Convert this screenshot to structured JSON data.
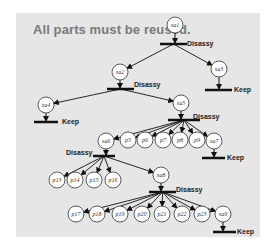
{
  "title": "All parts must be reused.",
  "colors": {
    "panel": "#e6e6e6",
    "title": "#7a7a7a",
    "line": "#111111",
    "node_fill": "#ffffff"
  },
  "nodes": [
    {
      "id": "sa1",
      "x": 175,
      "y": 25
    },
    {
      "id": "sa2",
      "x": 120,
      "y": 72
    },
    {
      "id": "sa3",
      "x": 219,
      "y": 69
    },
    {
      "id": "sa4",
      "x": 46,
      "y": 105
    },
    {
      "id": "sa5",
      "x": 181,
      "y": 103
    },
    {
      "id": "sa6",
      "x": 106,
      "y": 141
    },
    {
      "id": "p5",
      "x": 128,
      "y": 140
    },
    {
      "id": "p6",
      "x": 145,
      "y": 140
    },
    {
      "id": "p7",
      "x": 163,
      "y": 140
    },
    {
      "id": "p8",
      "x": 180,
      "y": 140
    },
    {
      "id": "p9",
      "x": 197,
      "y": 140
    },
    {
      "id": "sa7",
      "x": 214,
      "y": 141
    },
    {
      "id": "p13",
      "x": 57,
      "y": 180
    },
    {
      "id": "p14",
      "x": 75,
      "y": 180
    },
    {
      "id": "p15",
      "x": 94,
      "y": 180
    },
    {
      "id": "p16",
      "x": 113,
      "y": 180
    },
    {
      "id": "sa8",
      "x": 161,
      "y": 175
    },
    {
      "id": "p17",
      "x": 76,
      "y": 214
    },
    {
      "id": "p18",
      "x": 97,
      "y": 214
    },
    {
      "id": "p19",
      "x": 120,
      "y": 214
    },
    {
      "id": "p20",
      "x": 142,
      "y": 214
    },
    {
      "id": "p21",
      "x": 162,
      "y": 214
    },
    {
      "id": "p22",
      "x": 182,
      "y": 214
    },
    {
      "id": "p23",
      "x": 202,
      "y": 214
    },
    {
      "id": "sa9",
      "x": 223,
      "y": 214
    }
  ],
  "operations": [
    {
      "type": "Disassy",
      "parent": "sa1",
      "bar": {
        "x1": 160,
        "x2": 187,
        "y": 44
      },
      "label": {
        "text": "Disassy",
        "x": 187,
        "y": 46
      },
      "children": [
        "sa2",
        "sa3"
      ]
    },
    {
      "type": "Disassy",
      "parent": "sa2",
      "bar": {
        "x1": 107,
        "x2": 134,
        "y": 89
      },
      "label": {
        "text": "Disassy",
        "x": 134,
        "y": 87
      },
      "children": [
        "sa4",
        "sa5"
      ]
    },
    {
      "type": "Keep",
      "parent": "sa3",
      "bar": {
        "x1": 205,
        "x2": 232,
        "y": 90
      },
      "label": {
        "text": "Keep",
        "x": 234,
        "y": 92
      },
      "children": []
    },
    {
      "type": "Keep",
      "parent": "sa4",
      "bar": {
        "x1": 34,
        "x2": 58,
        "y": 122
      },
      "label": {
        "text": "Keep",
        "x": 62,
        "y": 124
      },
      "children": []
    },
    {
      "type": "Disassy",
      "parent": "sa5",
      "bar": {
        "x1": 168,
        "x2": 200,
        "y": 120
      },
      "label": {
        "text": "Disassy",
        "x": 193,
        "y": 119
      },
      "children": [
        "sa6",
        "p5",
        "p6",
        "p7",
        "p8",
        "p9",
        "sa7"
      ]
    },
    {
      "type": "Keep",
      "parent": "sa7",
      "bar": {
        "x1": 202,
        "x2": 225,
        "y": 158
      },
      "label": {
        "text": "Keep",
        "x": 227,
        "y": 160
      },
      "children": []
    },
    {
      "type": "Disassy",
      "parent": "sa6",
      "bar": {
        "x1": 93,
        "x2": 115,
        "y": 156
      },
      "label": {
        "text": "Disassy",
        "x": 66,
        "y": 155
      },
      "children": [
        "p13",
        "p14",
        "p15",
        "p16",
        "sa8"
      ]
    },
    {
      "type": "Disassy",
      "parent": "sa8",
      "bar": {
        "x1": 149,
        "x2": 176,
        "y": 192
      },
      "label": {
        "text": "Disassy",
        "x": 176,
        "y": 192
      },
      "children": [
        "p17",
        "p18",
        "p19",
        "p20",
        "p21",
        "p22",
        "p23",
        "sa9"
      ]
    },
    {
      "type": "Keep",
      "parent": "sa9",
      "bar": {
        "x1": 213,
        "x2": 236,
        "y": 232
      },
      "label": {
        "text": "Keep",
        "x": 237,
        "y": 234
      },
      "children": []
    }
  ]
}
